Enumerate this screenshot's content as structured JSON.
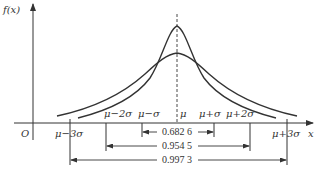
{
  "diagram": {
    "y_axis_label": "f(x)",
    "x_axis_label": "x",
    "origin_label": "O",
    "mean_label": "μ",
    "tick_labels": {
      "m3": "μ−3σ",
      "m2": "μ−2σ",
      "m1": "μ−σ",
      "p1": "μ+σ",
      "p2": "μ+2σ",
      "p3": "μ+3σ"
    },
    "intervals": [
      {
        "range": "μ±σ",
        "probability": "0.682 6"
      },
      {
        "range": "μ±2σ",
        "probability": "0.954 5"
      },
      {
        "range": "μ±3σ",
        "probability": "0.997 3"
      }
    ],
    "curves": [
      {
        "name": "narrow",
        "description": "taller, narrower normal curve"
      },
      {
        "name": "wide",
        "description": "shorter, wider normal curve"
      }
    ],
    "colors": {
      "stroke": "#333333",
      "background": "#ffffff"
    }
  }
}
